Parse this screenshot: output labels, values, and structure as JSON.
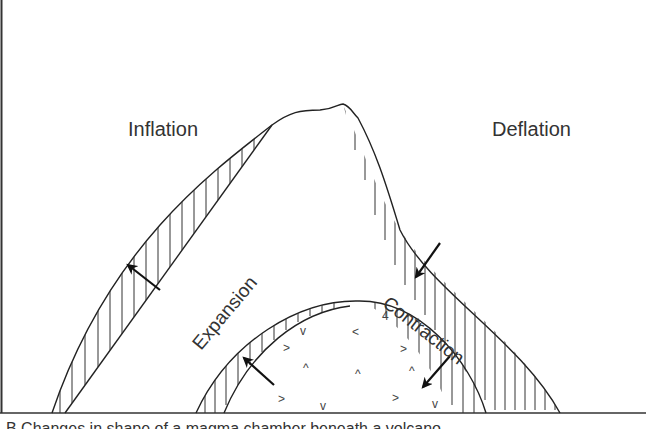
{
  "diagram": {
    "labels": {
      "inflation": "Inflation",
      "deflation": "Deflation",
      "expansion": "Expansion",
      "contraction": "Contraction"
    },
    "caption": "B  Changes in shape of a magma chamber beneath a volcano",
    "colors": {
      "line": "#222222",
      "background": "#ffffff",
      "text": "#333333"
    },
    "symbols": {
      "magma_marks": [
        "v",
        ">",
        "^",
        "<"
      ]
    },
    "arrows": [
      {
        "name": "inflation-arrow",
        "direction": "up-left"
      },
      {
        "name": "deflation-arrow",
        "direction": "down-left"
      },
      {
        "name": "expansion-arrow",
        "direction": "up-left"
      },
      {
        "name": "contraction-arrow",
        "direction": "down-left"
      }
    ]
  }
}
